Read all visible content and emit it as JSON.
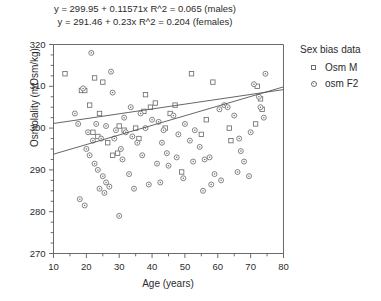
{
  "annotations": {
    "equation_male": "y = 299.95 + 0.11571x   R^2 = 0.065 (males)",
    "equation_female": "y = 291.46 + 0.23x   R^2 = 0.204 (females)"
  },
  "legend": {
    "title": "Sex bias data",
    "items": [
      {
        "label": "Osm M",
        "marker": "open-square-icon"
      },
      {
        "label": "osm F2",
        "marker": "dotted-circle-icon"
      }
    ]
  },
  "axes": {
    "xlabel": "Age (years)",
    "ylabel": "Osmolality (mOsm/kg)",
    "xticks": [
      "10",
      "20",
      "30",
      "40",
      "50",
      "60",
      "70",
      "80"
    ],
    "yticks": [
      "270",
      "280",
      "290",
      "300",
      "310",
      "320"
    ]
  },
  "chart_data": {
    "type": "scatter",
    "title": "",
    "xlabel": "Age (years)",
    "ylabel": "Osmolality (mOsm/kg)",
    "xlim": [
      10,
      80
    ],
    "ylim": [
      270,
      320
    ],
    "xticks": [
      10,
      20,
      30,
      40,
      50,
      60,
      70,
      80
    ],
    "yticks": [
      270,
      280,
      290,
      300,
      310,
      320
    ],
    "xminor_step": 5,
    "yminor_step": 2.5,
    "grid": false,
    "legend_position": "right",
    "legend_title": "Sex bias data",
    "marker_color": "#6e6e6e",
    "line_color": "#555555",
    "series": [
      {
        "name": "Osm M",
        "marker": "open-square",
        "points": [
          [
            18.5,
            309.0
          ],
          [
            19.5,
            309.0
          ],
          [
            22.5,
            312.0
          ],
          [
            25.0,
            311.0
          ],
          [
            21.0,
            305.5
          ],
          [
            38.0,
            308.0
          ],
          [
            39.5,
            305.0
          ],
          [
            41.0,
            306.0
          ],
          [
            30.0,
            300.5
          ],
          [
            35.0,
            300.0
          ],
          [
            47.0,
            305.5
          ],
          [
            52.0,
            313.0
          ],
          [
            31.5,
            299.5
          ],
          [
            23.5,
            298.0
          ],
          [
            22.0,
            299.0
          ],
          [
            44.0,
            300.0
          ],
          [
            56.5,
            302.0
          ],
          [
            63.5,
            300.0
          ],
          [
            71.5,
            301.0
          ],
          [
            72.0,
            310.0
          ],
          [
            73.0,
            307.0
          ],
          [
            73.5,
            304.5
          ],
          [
            13.5,
            313.0
          ],
          [
            28.0,
            293.5
          ],
          [
            29.5,
            294.0
          ],
          [
            55.0,
            298.5
          ],
          [
            64.0,
            297.0
          ],
          [
            49.0,
            289.5
          ],
          [
            36.0,
            297.5
          ],
          [
            37.5,
            304.0
          ],
          [
            45.5,
            303.5
          ],
          [
            24.0,
            303.5
          ],
          [
            26.5,
            296.5
          ],
          [
            58.5,
            311.0
          ]
        ]
      },
      {
        "name": "osm F2",
        "marker": "dotted-circle",
        "points": [
          [
            21.5,
            318.0
          ],
          [
            27.5,
            313.5
          ],
          [
            19.0,
            309.5
          ],
          [
            33.5,
            305.0
          ],
          [
            36.5,
            303.5
          ],
          [
            38.0,
            300.0
          ],
          [
            23.0,
            301.0
          ],
          [
            26.0,
            300.5
          ],
          [
            29.0,
            299.5
          ],
          [
            32.0,
            299.0
          ],
          [
            20.5,
            299.0
          ],
          [
            22.0,
            297.0
          ],
          [
            24.5,
            297.5
          ],
          [
            28.5,
            297.5
          ],
          [
            34.0,
            298.0
          ],
          [
            40.0,
            302.0
          ],
          [
            42.0,
            301.5
          ],
          [
            46.5,
            303.0
          ],
          [
            43.5,
            299.5
          ],
          [
            20.0,
            295.0
          ],
          [
            21.0,
            293.5
          ],
          [
            22.5,
            291.5
          ],
          [
            23.5,
            290.0
          ],
          [
            25.0,
            288.5
          ],
          [
            26.0,
            287.0
          ],
          [
            27.0,
            286.0
          ],
          [
            24.0,
            285.5
          ],
          [
            25.5,
            284.5
          ],
          [
            30.5,
            295.0
          ],
          [
            31.0,
            292.5
          ],
          [
            33.0,
            289.0
          ],
          [
            35.5,
            296.5
          ],
          [
            37.0,
            293.5
          ],
          [
            39.0,
            286.5
          ],
          [
            41.5,
            291.5
          ],
          [
            44.5,
            294.0
          ],
          [
            48.0,
            298.5
          ],
          [
            50.0,
            301.0
          ],
          [
            51.5,
            297.0
          ],
          [
            53.0,
            299.5
          ],
          [
            54.5,
            295.5
          ],
          [
            56.0,
            292.5
          ],
          [
            57.5,
            293.0
          ],
          [
            59.0,
            289.0
          ],
          [
            60.5,
            304.5
          ],
          [
            62.0,
            305.5
          ],
          [
            63.0,
            305.0
          ],
          [
            65.0,
            303.0
          ],
          [
            66.5,
            297.5
          ],
          [
            68.0,
            292.0
          ],
          [
            69.5,
            288.5
          ],
          [
            71.0,
            310.5
          ],
          [
            72.5,
            307.5
          ],
          [
            73.0,
            305.0
          ],
          [
            74.0,
            302.5
          ],
          [
            74.5,
            313.0
          ],
          [
            18.0,
            283.0
          ],
          [
            19.5,
            281.5
          ],
          [
            30.0,
            279.0
          ],
          [
            45.0,
            291.0
          ],
          [
            47.5,
            293.0
          ],
          [
            49.5,
            288.0
          ],
          [
            58.0,
            286.5
          ],
          [
            61.0,
            287.5
          ],
          [
            66.0,
            289.5
          ],
          [
            52.5,
            292.0
          ],
          [
            43.0,
            296.5
          ],
          [
            16.5,
            303.5
          ],
          [
            17.5,
            301.0
          ],
          [
            34.5,
            285.5
          ],
          [
            42.5,
            287.0
          ],
          [
            55.5,
            285.0
          ],
          [
            67.0,
            294.5
          ],
          [
            70.0,
            299.0
          ],
          [
            28.0,
            308.5
          ],
          [
            31.5,
            302.5
          ]
        ]
      }
    ],
    "fits": [
      {
        "name": "males",
        "equation": "y = 299.95 + 0.11571x",
        "intercept": 299.95,
        "slope": 0.11571,
        "r2": 0.065
      },
      {
        "name": "females",
        "equation": "y = 291.46 + 0.23x",
        "intercept": 291.46,
        "slope": 0.23,
        "r2": 0.204
      }
    ]
  }
}
